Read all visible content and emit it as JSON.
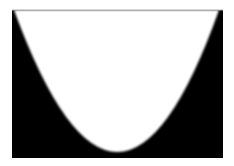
{
  "figure": {
    "colors": {
      "background": "#ffffff",
      "fill": "#000000",
      "parabola_interior": "#ffffff",
      "top_border": "#b0b0b0"
    },
    "rect": {
      "x": 12,
      "y": 10,
      "width": 211,
      "height": 148
    },
    "parabola": {
      "vertex": {
        "x": 118,
        "y": 152
      },
      "top_left": {
        "x": 14,
        "y": 10
      },
      "top_right": {
        "x": 219,
        "y": 10
      }
    }
  }
}
